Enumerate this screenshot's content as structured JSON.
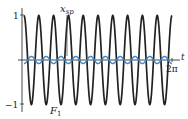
{
  "chart_data": {
    "type": "line",
    "title": "",
    "xlabel": "t",
    "ylabel": "",
    "xlim": [
      0,
      6.2832
    ],
    "ylim": [
      -1,
      1
    ],
    "x_tick_labels": [
      "2π"
    ],
    "y_tick_labels": [
      "1",
      "-1"
    ],
    "grid": false,
    "legend": null,
    "series": [
      {
        "name": "F1",
        "label": "F",
        "label_subscript": "1",
        "color": "#222222",
        "description": "cos(10t), amplitude 1, 10 periods over [0, 2π]",
        "amplitude": 1,
        "frequency": 10,
        "phase": 0
      },
      {
        "name": "x_sp",
        "label": "x",
        "label_subscript": "sp",
        "color": "#3a86c8",
        "description": "small-amplitude oscillation around 0, same frequency",
        "amplitude": 0.08,
        "frequency": 10,
        "phase": 3.1416
      }
    ]
  },
  "labels": {
    "t_axis": "t",
    "two_pi": "2π",
    "y_top": "1",
    "y_bottom": "−1",
    "xsp_main": "x",
    "xsp_sub": "sp",
    "f1_main": "F",
    "f1_sub": "1"
  }
}
